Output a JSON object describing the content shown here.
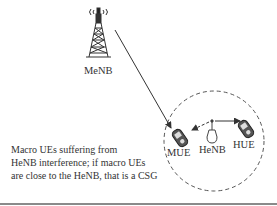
{
  "diagram": {
    "nodes": {
      "macro_base_station": {
        "label": "MeNB",
        "icon": "cell-tower-icon"
      },
      "home_base_station": {
        "label": "HeNB",
        "icon": "femtocell-icon"
      },
      "macro_ue": {
        "label": "MUE",
        "icon": "mobile-phone-icon"
      },
      "home_ue": {
        "label": "HUE",
        "icon": "mobile-phone-icon"
      }
    },
    "edges": [
      {
        "from": "MeNB",
        "to": "MUE",
        "style": "solid",
        "arrow": "end"
      },
      {
        "from": "HeNB",
        "to": "HUE",
        "style": "solid",
        "arrow": "end"
      },
      {
        "from": "HeNB",
        "to": "MUE",
        "style": "dashed",
        "arrow": "end"
      }
    ],
    "region": {
      "shape": "circle",
      "style": "dashed",
      "contains": [
        "MUE",
        "HeNB",
        "HUE"
      ]
    },
    "caption_lines": [
      "Macro UEs suffering from",
      "HeNB interference; if macro UEs",
      "are close to the HeNB, that is a CSG"
    ],
    "colors": {
      "line": "#333333",
      "dashed_circle": "#555555",
      "rule": "#8a8a8a"
    }
  }
}
